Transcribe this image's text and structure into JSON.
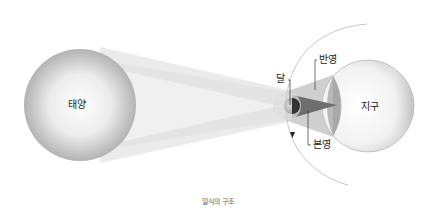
{
  "title": "일식의 구조",
  "labels": {
    "sun": "태양",
    "moon": "달",
    "earth": "지구",
    "penumbra": "반영",
    "umbra": "본영"
  },
  "caption": "일식의 구조",
  "colors": {
    "sun_edge": "#a9a9a9",
    "sun_center": "#ffffff",
    "light_cone": "#e4e4e4",
    "penumbra": "#b4b4b4",
    "umbra": "#6e6e6e",
    "earth_fill": "#f6f6f6",
    "orbit": "#b0b0b0"
  }
}
